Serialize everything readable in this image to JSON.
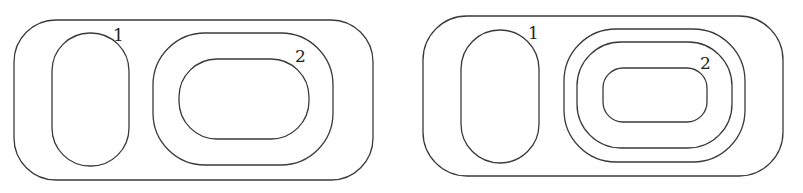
{
  "diagrams": [
    {
      "name": "left-diagram",
      "outer": {
        "x": 14,
        "y": 20,
        "w": 359,
        "h": 160,
        "r": 42
      },
      "region_1": {
        "x": 52,
        "y": 33,
        "w": 77,
        "h": 133,
        "r": 38,
        "label": "1",
        "label_x": 113,
        "label_y": 41
      },
      "region_2_curves": [
        {
          "x": 153,
          "y": 33,
          "w": 180,
          "h": 132,
          "r": 52
        },
        {
          "x": 179,
          "y": 59,
          "w": 130,
          "h": 80,
          "r": 38
        }
      ],
      "region_2_label": {
        "text": "2",
        "x": 295,
        "y": 62
      }
    },
    {
      "name": "right-diagram",
      "outer": {
        "x": 423,
        "y": 16,
        "w": 360,
        "h": 160,
        "r": 44
      },
      "region_1": {
        "x": 461,
        "y": 30,
        "w": 78,
        "h": 133,
        "r": 39,
        "label": "1",
        "label_x": 528,
        "label_y": 39
      },
      "region_2_curves": [
        {
          "x": 564,
          "y": 29,
          "w": 181,
          "h": 133,
          "r": 52
        },
        {
          "x": 577,
          "y": 42,
          "w": 155,
          "h": 106,
          "r": 44
        },
        {
          "x": 603,
          "y": 68,
          "w": 104,
          "h": 54,
          "r": 20
        }
      ],
      "region_2_label": {
        "text": "2",
        "x": 700,
        "y": 69
      }
    }
  ],
  "labels": {
    "left_1": "1",
    "left_2": "2",
    "right_1": "1",
    "right_2": "2"
  }
}
